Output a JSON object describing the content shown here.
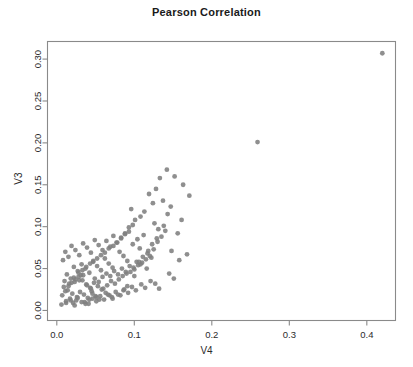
{
  "chart_data": {
    "type": "scatter",
    "title": "Pearson Correlation",
    "xlabel": "V4",
    "ylabel": "V3",
    "xlim": [
      -0.012,
      0.437
    ],
    "ylim": [
      -0.012,
      0.321
    ],
    "xticks": [
      0.0,
      0.1,
      0.2,
      0.3,
      0.4
    ],
    "xtick_labels": [
      "0.0",
      "0.1",
      "0.2",
      "0.3",
      "0.4"
    ],
    "yticks": [
      0.0,
      0.05,
      0.1,
      0.15,
      0.2,
      0.25,
      0.3
    ],
    "ytick_labels": [
      "0.00",
      "0.05",
      "0.10",
      "0.15",
      "0.20",
      "0.25",
      "0.30"
    ],
    "grid": false,
    "legend": null,
    "point_color": "#808080",
    "point_radius": 2.4,
    "frame_color": "#8a8a8a",
    "series": [
      {
        "name": "V3 vs V4",
        "x": [
          0.42,
          0.259,
          0.163,
          0.171,
          0.152,
          0.142,
          0.133,
          0.128,
          0.137,
          0.147,
          0.119,
          0.124,
          0.113,
          0.108,
          0.126,
          0.131,
          0.101,
          0.096,
          0.112,
          0.104,
          0.168,
          0.158,
          0.148,
          0.093,
          0.088,
          0.083,
          0.098,
          0.107,
          0.117,
          0.122,
          0.078,
          0.073,
          0.069,
          0.064,
          0.081,
          0.086,
          0.091,
          0.059,
          0.054,
          0.049,
          0.062,
          0.067,
          0.072,
          0.044,
          0.039,
          0.034,
          0.047,
          0.052,
          0.057,
          0.029,
          0.024,
          0.019,
          0.032,
          0.037,
          0.042,
          0.015,
          0.011,
          0.022,
          0.027,
          0.031,
          0.008,
          0.013,
          0.018,
          0.023,
          0.028,
          0.033,
          0.038,
          0.043,
          0.048,
          0.053,
          0.058,
          0.063,
          0.068,
          0.009,
          0.014,
          0.02,
          0.026,
          0.03,
          0.035,
          0.04,
          0.045,
          0.05,
          0.055,
          0.06,
          0.065,
          0.07,
          0.075,
          0.08,
          0.085,
          0.09,
          0.095,
          0.1,
          0.105,
          0.11,
          0.115,
          0.12,
          0.125,
          0.13,
          0.135,
          0.14,
          0.012,
          0.017,
          0.021,
          0.025,
          0.036,
          0.041,
          0.046,
          0.051,
          0.056,
          0.061,
          0.066,
          0.071,
          0.076,
          0.082,
          0.087,
          0.092,
          0.097,
          0.102,
          0.109,
          0.114,
          0.01,
          0.016,
          0.022,
          0.029,
          0.034,
          0.039,
          0.044,
          0.049,
          0.054,
          0.059,
          0.064,
          0.069,
          0.074,
          0.079,
          0.084,
          0.089,
          0.094,
          0.099,
          0.103,
          0.108,
          0.007,
          0.011,
          0.015,
          0.019,
          0.024,
          0.028,
          0.033,
          0.038,
          0.043,
          0.047,
          0.052,
          0.057,
          0.062,
          0.067,
          0.073,
          0.077,
          0.083,
          0.088,
          0.093,
          0.098,
          0.006,
          0.012,
          0.018,
          0.023,
          0.027,
          0.032,
          0.037,
          0.042,
          0.046,
          0.051,
          0.156,
          0.161,
          0.143,
          0.138,
          0.129,
          0.123,
          0.118,
          0.111,
          0.106,
          0.116,
          0.145,
          0.151,
          0.127,
          0.132,
          0.121,
          0.1,
          0.091,
          0.086,
          0.079,
          0.072
        ],
        "y": [
          0.307,
          0.201,
          0.15,
          0.137,
          0.16,
          0.168,
          0.158,
          0.145,
          0.131,
          0.124,
          0.139,
          0.128,
          0.118,
          0.112,
          0.104,
          0.097,
          0.108,
          0.121,
          0.09,
          0.085,
          0.067,
          0.06,
          0.071,
          0.099,
          0.092,
          0.086,
          0.079,
          0.074,
          0.068,
          0.063,
          0.081,
          0.089,
          0.076,
          0.083,
          0.07,
          0.065,
          0.059,
          0.072,
          0.078,
          0.084,
          0.062,
          0.056,
          0.051,
          0.069,
          0.075,
          0.08,
          0.058,
          0.053,
          0.048,
          0.066,
          0.072,
          0.077,
          0.055,
          0.05,
          0.045,
          0.064,
          0.07,
          0.052,
          0.047,
          0.042,
          0.06,
          0.043,
          0.038,
          0.034,
          0.04,
          0.036,
          0.031,
          0.027,
          0.033,
          0.029,
          0.025,
          0.021,
          0.018,
          0.028,
          0.024,
          0.02,
          0.016,
          0.022,
          0.019,
          0.015,
          0.023,
          0.017,
          0.013,
          0.026,
          0.03,
          0.035,
          0.032,
          0.037,
          0.041,
          0.044,
          0.046,
          0.049,
          0.054,
          0.057,
          0.061,
          0.065,
          0.073,
          0.082,
          0.088,
          0.095,
          0.011,
          0.014,
          0.009,
          0.012,
          0.01,
          0.008,
          0.014,
          0.011,
          0.017,
          0.013,
          0.019,
          0.016,
          0.022,
          0.018,
          0.025,
          0.021,
          0.028,
          0.024,
          0.031,
          0.027,
          0.035,
          0.032,
          0.039,
          0.036,
          0.042,
          0.03,
          0.026,
          0.038,
          0.034,
          0.04,
          0.044,
          0.041,
          0.047,
          0.043,
          0.05,
          0.046,
          0.053,
          0.051,
          0.058,
          0.055,
          0.018,
          0.023,
          0.029,
          0.033,
          0.037,
          0.045,
          0.048,
          0.052,
          0.056,
          0.059,
          0.062,
          0.066,
          0.069,
          0.074,
          0.077,
          0.081,
          0.087,
          0.091,
          0.094,
          0.102,
          0.007,
          0.009,
          0.012,
          0.006,
          0.015,
          0.01,
          0.008,
          0.013,
          0.02,
          0.016,
          0.092,
          0.108,
          0.115,
          0.101,
          0.086,
          0.079,
          0.071,
          0.064,
          0.058,
          0.05,
          0.044,
          0.038,
          0.032,
          0.026,
          0.035,
          0.041,
          0.029,
          0.024,
          0.019,
          0.014
        ]
      }
    ]
  }
}
